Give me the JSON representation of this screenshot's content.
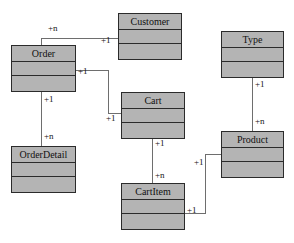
{
  "diagram": {
    "type": "uml-class-diagram",
    "background_color": "#ffffff",
    "box_fill_color": "#b4b4b4",
    "box_border_color": "#2b2b2b",
    "edge_color": "#6e6e6e",
    "classes": [
      {
        "id": "order",
        "name": "Order",
        "x": 11,
        "y": 45,
        "w": 65,
        "h": 47
      },
      {
        "id": "customer",
        "name": "Customer",
        "x": 118,
        "y": 13,
        "w": 64,
        "h": 47
      },
      {
        "id": "type",
        "name": "Type",
        "x": 221,
        "y": 31,
        "w": 63,
        "h": 47
      },
      {
        "id": "cart",
        "name": "Cart",
        "x": 121,
        "y": 92,
        "w": 64,
        "h": 47
      },
      {
        "id": "orderdetail",
        "name": "OrderDetail",
        "x": 11,
        "y": 146,
        "w": 65,
        "h": 47
      },
      {
        "id": "product",
        "name": "Product",
        "x": 221,
        "y": 131,
        "w": 63,
        "h": 47
      },
      {
        "id": "cartitem",
        "name": "CartItem",
        "x": 121,
        "y": 183,
        "w": 64,
        "h": 47
      }
    ],
    "associations": [
      {
        "id": "order-customer",
        "from": "order",
        "to": "customer",
        "from_mult": "+n",
        "to_mult": "+1"
      },
      {
        "id": "order-cart",
        "from": "order",
        "to": "cart",
        "from_mult": "+1",
        "to_mult": "+1"
      },
      {
        "id": "order-orderdetail",
        "from": "order",
        "to": "orderdetail",
        "from_mult": "+1",
        "to_mult": "+n"
      },
      {
        "id": "cart-cartitem",
        "from": "cart",
        "to": "cartitem",
        "from_mult": "+1",
        "to_mult": "+n"
      },
      {
        "id": "type-product",
        "from": "type",
        "to": "product",
        "from_mult": "+1",
        "to_mult": "+n"
      },
      {
        "id": "cartitem-product",
        "from": "cartitem",
        "to": "product",
        "from_mult": "+1",
        "to_mult": "+1"
      }
    ],
    "multiplicity_labels": [
      {
        "id": "order-customer-n",
        "text": "+n",
        "x": 48,
        "y": 23
      },
      {
        "id": "order-customer-1",
        "text": "+1",
        "x": 101,
        "y": 35
      },
      {
        "id": "order-cart-1",
        "text": "+1",
        "x": 78,
        "y": 68
      },
      {
        "id": "cart-left-1",
        "text": "+1",
        "x": 105,
        "y": 115
      },
      {
        "id": "order-detail-1",
        "text": "+1",
        "x": 44,
        "y": 94
      },
      {
        "id": "order-detail-n",
        "text": "+n",
        "x": 44,
        "y": 131
      },
      {
        "id": "cart-cartitem-1",
        "text": "+1",
        "x": 155,
        "y": 140
      },
      {
        "id": "cart-cartitem-n",
        "text": "+n",
        "x": 155,
        "y": 170
      },
      {
        "id": "type-product-1",
        "text": "+1",
        "x": 255,
        "y": 80
      },
      {
        "id": "type-product-n",
        "text": "+n",
        "x": 255,
        "y": 116
      },
      {
        "id": "product-cartitem-1",
        "text": "+1",
        "x": 196,
        "y": 158
      },
      {
        "id": "cartitem-product-1",
        "text": "+1",
        "x": 187,
        "y": 204
      }
    ]
  }
}
